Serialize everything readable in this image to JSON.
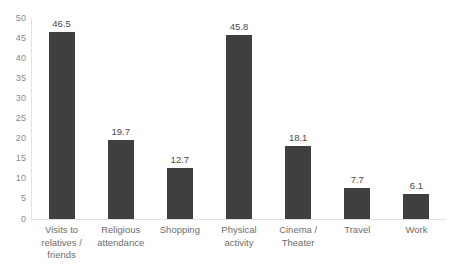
{
  "chart_data": {
    "type": "bar",
    "title": "",
    "subtitle": "",
    "xlabel": "",
    "ylabel": "",
    "ylim": [
      0,
      50
    ],
    "ytick_step": 5,
    "yticks": [
      "0",
      "5",
      "10",
      "15",
      "20",
      "25",
      "30",
      "35",
      "40",
      "45",
      "50"
    ],
    "grid": false,
    "legend": false,
    "legend_position": "none",
    "categories": [
      "Visits to relatives / friends",
      "Religious attendance",
      "Shopping",
      "Physical activity",
      "Cinema / Theater",
      "Travel",
      "Work"
    ],
    "category_lines": [
      [
        "Visits to",
        "relatives /",
        "friends"
      ],
      [
        "Religious",
        "attendance"
      ],
      [
        "Shopping"
      ],
      [
        "Physical",
        "activity"
      ],
      [
        "Cinema /",
        "Theater"
      ],
      [
        "Travel"
      ],
      [
        "Work"
      ]
    ],
    "values": [
      46.5,
      19.7,
      12.7,
      45.8,
      18.1,
      7.7,
      6.1
    ],
    "data_labels": [
      "46.5",
      "19.7",
      "12.7",
      "45.8",
      "18.1",
      "7.7",
      "6.1"
    ],
    "colors": {
      "bar_fill": "#3f3f3f",
      "axis_line": "#e2e2e2",
      "tick_text": "#8a8a8a",
      "category_text": "#6e6e6e",
      "value_text": "#4a4a4a",
      "background": "#ffffff"
    }
  }
}
